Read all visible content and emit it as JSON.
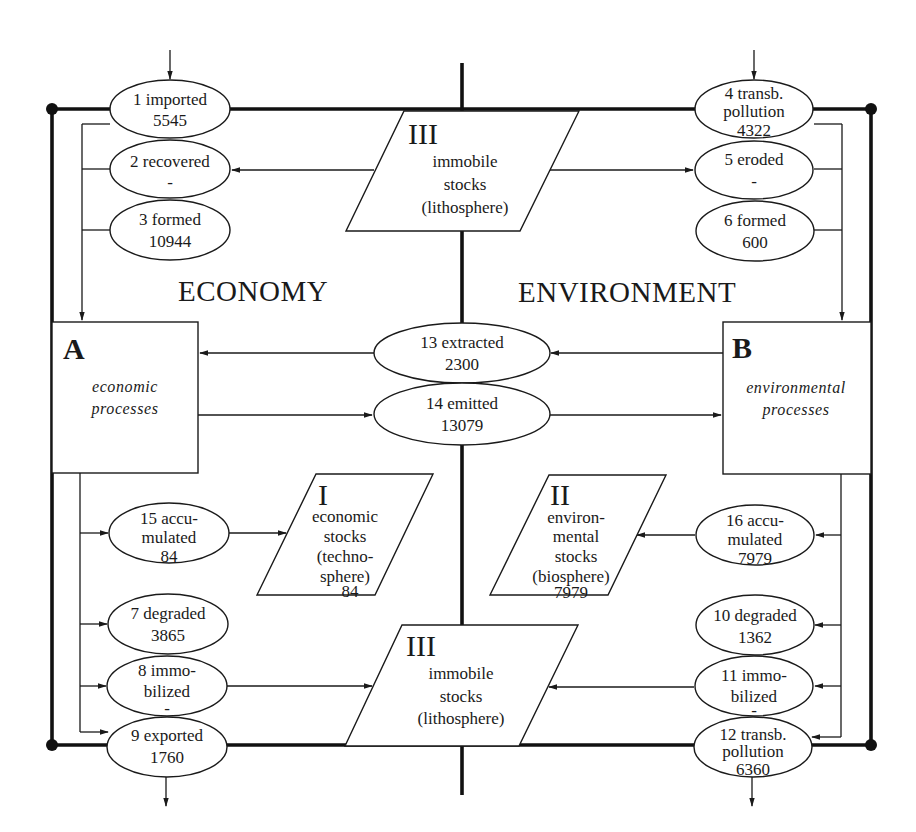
{
  "diagram": {
    "headings": {
      "economy": "ECONOMY",
      "environment": "ENVIRONMENT"
    },
    "processes": {
      "A": {
        "letter": "A",
        "line1": "economic",
        "line2": "processes"
      },
      "B": {
        "letter": "B",
        "line1": "environmental",
        "line2": "processes"
      }
    },
    "stocks": {
      "top": {
        "roman": "III",
        "lines": [
          "immobile",
          "stocks",
          "(lithosphere)"
        ]
      },
      "economic": {
        "roman": "I",
        "lines": [
          "economic",
          "stocks",
          "(techno-",
          "sphere)",
          "84"
        ]
      },
      "environmental": {
        "roman": "II",
        "lines": [
          "environ-",
          "mental",
          "stocks",
          "(biosphere)",
          "7979"
        ]
      },
      "bottom": {
        "roman": "III",
        "lines": [
          "immobile",
          "stocks",
          "(lithosphere)"
        ]
      }
    },
    "flows": {
      "f1": {
        "lines": [
          "1 imported",
          "5545"
        ]
      },
      "f2": {
        "lines": [
          "2 recovered",
          "-"
        ]
      },
      "f3": {
        "lines": [
          "3 formed",
          "10944"
        ]
      },
      "f4": {
        "lines": [
          "4 transb.",
          "pollution",
          "4322"
        ]
      },
      "f5": {
        "lines": [
          "5 eroded",
          "-"
        ]
      },
      "f6": {
        "lines": [
          "6 formed",
          "600"
        ]
      },
      "f7": {
        "lines": [
          "7 degraded",
          "3865"
        ]
      },
      "f8": {
        "lines": [
          "8 immo-",
          "bilized",
          "-"
        ]
      },
      "f9": {
        "lines": [
          "9 exported",
          "1760"
        ]
      },
      "f10": {
        "lines": [
          "10 degraded",
          "1362"
        ]
      },
      "f11": {
        "lines": [
          "11 immo-",
          "bilized",
          "-"
        ]
      },
      "f12": {
        "lines": [
          "12 transb.",
          "pollution",
          "6360"
        ]
      },
      "f13": {
        "lines": [
          "13 extracted",
          "2300"
        ]
      },
      "f14": {
        "lines": [
          "14 emitted",
          "13079"
        ]
      },
      "f15": {
        "lines": [
          "15 accu-",
          "mulated",
          "84"
        ]
      },
      "f16": {
        "lines": [
          "16 accu-",
          "mulated",
          "7979"
        ]
      }
    },
    "colors": {
      "ink": "#1a1a1a",
      "background": "#ffffff"
    }
  }
}
